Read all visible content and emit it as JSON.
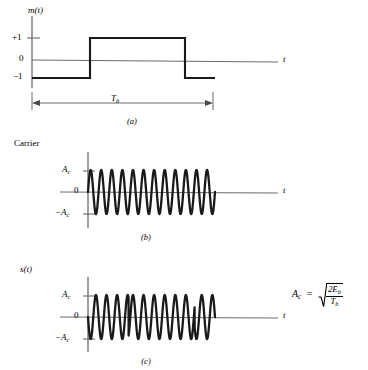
{
  "figure": {
    "background_color": "#ffffff",
    "ink_color": "#000000",
    "axis_color": "#6b6b6b",
    "width": 368,
    "height": 370
  },
  "panel_a": {
    "caption": "(a)",
    "signal_label": "m(",
    "signal_label_var": "t",
    "signal_label_close": ")",
    "axis_label_t": "t",
    "ticks": {
      "plus_one": "+1",
      "zero": "0",
      "minus_one": "−1"
    },
    "duration_label_base": "T",
    "duration_label_sub": "b"
  },
  "panel_b": {
    "caption": "(b)",
    "title": "Carrier",
    "axis_label_t": "t",
    "ticks": {
      "amplitude": "A",
      "amplitude_sub": "c",
      "zero": "0",
      "neg_amplitude": "−A",
      "neg_amplitude_sub": "c"
    }
  },
  "panel_c": {
    "caption": "(c)",
    "signal_label": "s(",
    "signal_label_var": "t",
    "signal_label_close": ")",
    "axis_label_t": "t",
    "ticks": {
      "amplitude": "A",
      "amplitude_sub": "c",
      "zero": "0",
      "neg_amplitude": "−A",
      "neg_amplitude_sub": "c"
    }
  },
  "formula": {
    "lhs": "A",
    "lhs_sub": "c",
    "equals": "=",
    "numerator": "2E",
    "numerator_sub": "b",
    "denominator": "T",
    "denominator_sub": "b"
  },
  "chart_data": {
    "type": "line",
    "panels": [
      {
        "id": "a",
        "caption": "(a)",
        "ylabel": "m(t)",
        "xlabel": "t",
        "yticks": [
          1,
          0,
          -1
        ],
        "ytick_labels": [
          "+1",
          "0",
          "−1"
        ],
        "description": "Binary message signal: NRZ bipolar square wave, levels +1 and -1",
        "segments": [
          {
            "value": -1,
            "x_start": 0.0,
            "x_end": 0.32
          },
          {
            "value": 1,
            "x_start": 0.32,
            "x_end": 0.84
          },
          {
            "value": -1,
            "x_start": 0.84,
            "x_end": 1.0
          }
        ],
        "annotation": {
          "label": "T_b",
          "type": "double-arrow",
          "x_start": 0.0,
          "x_end": 1.0
        }
      },
      {
        "id": "b",
        "caption": "(b)",
        "ylabel": "Carrier",
        "xlabel": "t",
        "yticks": [
          1,
          0,
          -1
        ],
        "ytick_labels": [
          "A_c",
          "0",
          "−A_c"
        ],
        "description": "Unmodulated sinusoidal carrier of constant amplitude A_c",
        "waveform": "sine",
        "cycles": 12,
        "amplitude": 1,
        "phase_deg": 0,
        "x_start": 0.0,
        "x_end": 1.0
      },
      {
        "id": "c",
        "caption": "(c)",
        "ylabel": "s(t)",
        "xlabel": "t",
        "yticks": [
          1,
          0,
          -1
        ],
        "ytick_labels": [
          "A_c",
          "0",
          "−A_c"
        ],
        "description": "BPSK modulated wave: carrier multiplied by m(t), showing 180-degree phase reversals at bit transitions",
        "waveform": "sine",
        "cycles": 12,
        "amplitude": 1,
        "phase_segments": [
          {
            "x_start": 0.0,
            "x_end": 0.32,
            "phase_deg": 180
          },
          {
            "x_start": 0.32,
            "x_end": 0.84,
            "phase_deg": 0
          },
          {
            "x_start": 0.84,
            "x_end": 1.0,
            "phase_deg": 180
          }
        ]
      }
    ],
    "annotations": [
      {
        "text": "A_c = sqrt(2E_b / T_b)",
        "type": "formula",
        "position": "right-middle"
      }
    ]
  }
}
